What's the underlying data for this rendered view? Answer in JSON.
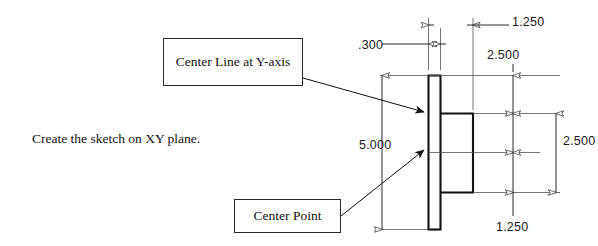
{
  "page": {
    "width": 598,
    "height": 246,
    "background": "#ffffff",
    "line_color": "#2a2a2a",
    "text_color": "#111111"
  },
  "notes": {
    "instruction": "Create the sketch on XY plane."
  },
  "callouts": [
    {
      "id": "center-line",
      "label": "Center Line at Y-axis"
    },
    {
      "id": "center-point",
      "label": "Center Point"
    }
  ],
  "drawing": {
    "title": "Part profile with dimensions",
    "units": "inches",
    "dimensions": [
      {
        "id": "thickness",
        "value": ".300",
        "orientation": "horizontal",
        "note": "plate thickness"
      },
      {
        "id": "boss-width",
        "value": "1.250",
        "orientation": "horizontal",
        "note": "boss projection width"
      },
      {
        "id": "top-offset",
        "value": "2.500",
        "orientation": "vertical",
        "note": "top of plate to top of boss"
      },
      {
        "id": "plate-height",
        "value": "5.000",
        "orientation": "vertical",
        "note": "overall plate height"
      },
      {
        "id": "boss-height",
        "value": "2.500",
        "orientation": "vertical",
        "note": "boss height"
      },
      {
        "id": "bottom-offset",
        "value": "1.250",
        "orientation": "vertical",
        "note": "center to bottom of boss"
      }
    ]
  }
}
